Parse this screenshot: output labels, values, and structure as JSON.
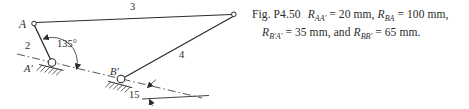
{
  "diagram": {
    "labels": {
      "joint_a": "A",
      "joint_b": "B",
      "ground_pivot_a": "A′",
      "ground_pivot_b": "B′",
      "link_2": "2",
      "link_3": "3",
      "link_4": "4",
      "angle_input": "135°",
      "angle_ground_incline": "15"
    }
  },
  "caption": {
    "figure_label": "Fig. P4.50",
    "terms": {
      "t1": {
        "base": "R",
        "sub": "AA′",
        "rest": " = 20 mm, "
      },
      "t2": {
        "base": "R",
        "sub": "BA",
        "rest": " = 100 mm,"
      },
      "t3": {
        "base": "R",
        "sub": "B′A′",
        "rest": " = 35 mm, and "
      },
      "t4": {
        "base": "R",
        "sub": "BB′",
        "rest": " = 65 mm."
      }
    }
  }
}
